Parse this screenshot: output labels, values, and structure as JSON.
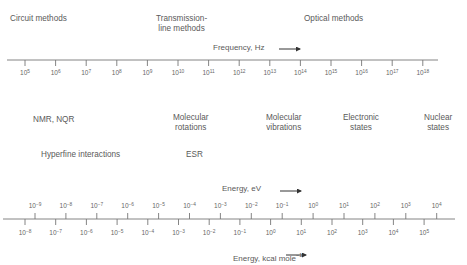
{
  "regions_top": [
    {
      "id": "circuit",
      "lines": [
        "Circuit methods"
      ]
    },
    {
      "id": "transmission",
      "lines": [
        "Transmission-",
        "line methods"
      ]
    },
    {
      "id": "optical",
      "lines": [
        "Optical methods"
      ]
    }
  ],
  "frequency_axis": {
    "label": "Frequency, Hz",
    "arrow": "→",
    "exponents": [
      "5",
      "6",
      "7",
      "8",
      "9",
      "10",
      "11",
      "12",
      "13",
      "14",
      "15",
      "16",
      "17",
      "18"
    ],
    "base": "10"
  },
  "phenomena": [
    {
      "id": "nmr",
      "lines": [
        "NMR, NQR"
      ]
    },
    {
      "id": "rotations",
      "lines": [
        "Molecular",
        "rotations"
      ]
    },
    {
      "id": "vibrations",
      "lines": [
        "Molecular",
        "vibrations"
      ]
    },
    {
      "id": "electronic",
      "lines": [
        "Electronic",
        "states"
      ]
    },
    {
      "id": "nuclear",
      "lines": [
        "Nuclear",
        "states"
      ]
    },
    {
      "id": "hyperfine",
      "lines": [
        "Hyperfine interactions"
      ]
    },
    {
      "id": "esr",
      "lines": [
        "ESR"
      ]
    }
  ],
  "energy_ev_axis": {
    "label": "Energy, eV",
    "arrow": "→",
    "base": "10",
    "exponents": [
      "−9",
      "−8",
      "−7",
      "−6",
      "−5",
      "−4",
      "−3",
      "−2",
      "−1",
      "0",
      "1",
      "2",
      "3",
      "4"
    ]
  },
  "energy_kcal_axis": {
    "label": "Energy, kcal mole",
    "label_sup": "−1",
    "arrow": "→",
    "base": "10",
    "exponents": [
      "−8",
      "−7",
      "−6",
      "−5",
      "−4",
      "−3",
      "−2",
      "−1",
      "0",
      "1",
      "2",
      "3",
      "4",
      "5"
    ]
  }
}
